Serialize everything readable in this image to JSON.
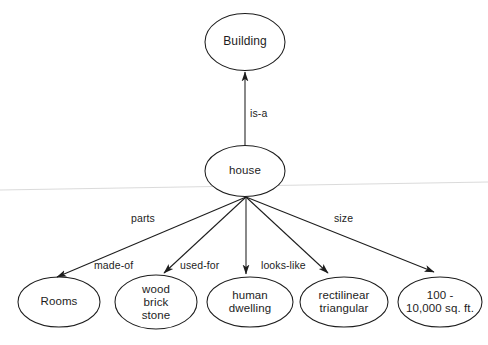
{
  "diagram": {
    "type": "semantic-network",
    "title": "",
    "background_color": "#ffffff",
    "stroke_color": "#1d1d1d",
    "text_color": "#1d1d1d",
    "nodes": [
      {
        "id": "building",
        "label": "Building",
        "cx": 245,
        "cy": 42,
        "rx": 40,
        "ry": 28.5,
        "font_size": 12
      },
      {
        "id": "house",
        "label": "house",
        "cx": 245,
        "cy": 171,
        "rx": 40,
        "ry": 25.5,
        "font_size": 11.5
      },
      {
        "id": "rooms",
        "label": "Rooms",
        "cx": 59,
        "cy": 302,
        "rx": 41,
        "ry": 25,
        "font_size": 11.5
      },
      {
        "id": "materials",
        "label": "wood\nbrick\nstone",
        "cx": 156,
        "cy": 302,
        "rx": 41,
        "ry": 27,
        "font_size": 11.5
      },
      {
        "id": "dwelling",
        "label": "human\ndwelling",
        "cx": 250,
        "cy": 302,
        "rx": 43,
        "ry": 25,
        "font_size": 11.5
      },
      {
        "id": "shape",
        "label": "rectilinear\ntriangular",
        "cx": 344,
        "cy": 302,
        "rx": 44,
        "ry": 25,
        "font_size": 11.5
      },
      {
        "id": "size",
        "label": "100 -\n10,000 sq. ft.",
        "cx": 440,
        "cy": 302,
        "rx": 42,
        "ry": 25,
        "font_size": 11.5
      }
    ],
    "edges": [
      {
        "id": "edge-is-a",
        "label": "is-a",
        "from": "house",
        "to": "building",
        "x1": 245,
        "y1": 145,
        "x2": 245,
        "y2": 72,
        "label_x": 250,
        "label_y": 107
      },
      {
        "id": "edge-parts",
        "label": "parts",
        "from": "house",
        "to": "rooms",
        "x1": 246,
        "y1": 197,
        "x2": 57,
        "y2": 277,
        "label_x": 131,
        "label_y": 212
      },
      {
        "id": "edge-made-of",
        "label": "made-of",
        "from": "house",
        "to": "materials",
        "x1": 246,
        "y1": 197,
        "x2": 164,
        "y2": 273,
        "label_x": 94,
        "label_y": 259
      },
      {
        "id": "edge-used-for",
        "label": "used-for",
        "from": "house",
        "to": "dwelling",
        "x1": 246,
        "y1": 197,
        "x2": 246,
        "y2": 274,
        "label_x": 180,
        "label_y": 259
      },
      {
        "id": "edge-looks-like",
        "label": "looks-like",
        "from": "house",
        "to": "shape",
        "x1": 246,
        "y1": 197,
        "x2": 328,
        "y2": 273,
        "label_x": 261,
        "label_y": 259
      },
      {
        "id": "edge-size",
        "label": "size",
        "from": "house",
        "to": "size",
        "x1": 246,
        "y1": 197,
        "x2": 434,
        "y2": 272,
        "label_x": 334,
        "label_y": 212
      }
    ]
  }
}
